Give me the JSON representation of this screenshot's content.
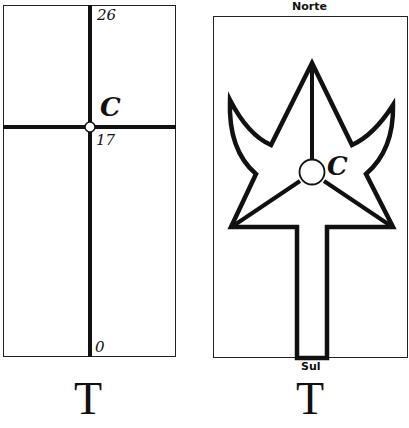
{
  "left_figure": {
    "labels": {
      "top": "26",
      "center_letter": "C",
      "center_value": "17",
      "bottom": "0"
    },
    "caption_letter": "T"
  },
  "right_figure": {
    "labels": {
      "north": "Norte",
      "south": "Sul",
      "center_letter": "C"
    },
    "caption_letter": "T"
  },
  "colors": {
    "ink": "#111111",
    "background": "#ffffff"
  }
}
